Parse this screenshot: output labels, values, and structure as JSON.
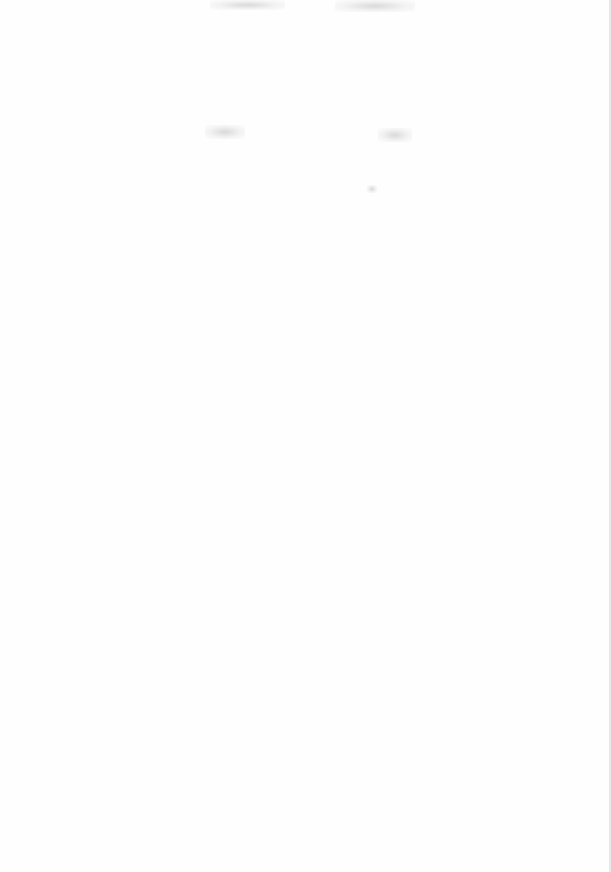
{
  "page": {
    "type": "scanned-blank-page",
    "background": "#fefefe",
    "marks": [
      {
        "name": "bleed-through-mark-top-left",
        "x": 210,
        "y": 0,
        "w": 75,
        "h": 10
      },
      {
        "name": "bleed-through-mark-top-right",
        "x": 335,
        "y": 0,
        "w": 80,
        "h": 12
      },
      {
        "name": "bleed-through-mark-mid-left",
        "x": 205,
        "y": 125,
        "w": 40,
        "h": 14
      },
      {
        "name": "bleed-through-mark-mid-right",
        "x": 378,
        "y": 128,
        "w": 34,
        "h": 14
      },
      {
        "name": "bleed-through-mark-dot",
        "x": 367,
        "y": 185,
        "w": 10,
        "h": 8
      }
    ]
  }
}
